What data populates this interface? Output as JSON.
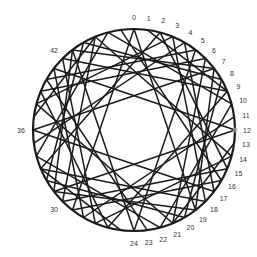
{
  "diagram": {
    "type": "circular-chord-diagram",
    "node_count": 48,
    "center": [
      134,
      130
    ],
    "radius": 101,
    "label_radius": 113,
    "colors": {
      "stroke": "#1a1a1a",
      "label": "#333333",
      "background": "#ffffff"
    },
    "labels": [
      {
        "node": 0,
        "text": "0"
      },
      {
        "node": 1,
        "text": "1"
      },
      {
        "node": 2,
        "text": "2"
      },
      {
        "node": 3,
        "text": "3"
      },
      {
        "node": 4,
        "text": "4"
      },
      {
        "node": 5,
        "text": "5"
      },
      {
        "node": 6,
        "text": "6"
      },
      {
        "node": 7,
        "text": "7"
      },
      {
        "node": 8,
        "text": "8"
      },
      {
        "node": 9,
        "text": "9"
      },
      {
        "node": 10,
        "text": "10"
      },
      {
        "node": 11,
        "text": "11"
      },
      {
        "node": 12,
        "text": "12"
      },
      {
        "node": 13,
        "text": "13"
      },
      {
        "node": 14,
        "text": "14"
      },
      {
        "node": 15,
        "text": "15"
      },
      {
        "node": 16,
        "text": "16"
      },
      {
        "node": 17,
        "text": "17"
      },
      {
        "node": 18,
        "text": "18"
      },
      {
        "node": 19,
        "text": "19"
      },
      {
        "node": 20,
        "text": "20"
      },
      {
        "node": 21,
        "text": "21"
      },
      {
        "node": 22,
        "text": "22"
      },
      {
        "node": 23,
        "text": "23"
      },
      {
        "node": 24,
        "text": "24"
      },
      {
        "node": 30,
        "text": "30"
      },
      {
        "node": 36,
        "text": "36"
      },
      {
        "node": 42,
        "text": "42"
      }
    ],
    "marker_node": 12,
    "chords": [
      [
        0,
        19
      ],
      [
        0,
        29
      ],
      [
        2,
        33
      ],
      [
        2,
        15
      ],
      [
        4,
        35
      ],
      [
        4,
        17
      ],
      [
        6,
        21
      ],
      [
        6,
        39
      ],
      [
        12,
        31
      ],
      [
        12,
        41
      ],
      [
        14,
        45
      ],
      [
        14,
        27
      ],
      [
        16,
        47
      ],
      [
        16,
        29
      ],
      [
        18,
        33
      ],
      [
        18,
        3
      ],
      [
        24,
        43
      ],
      [
        24,
        5
      ],
      [
        26,
        9
      ],
      [
        26,
        39
      ],
      [
        28,
        11
      ],
      [
        28,
        41
      ],
      [
        30,
        45
      ],
      [
        30,
        15
      ],
      [
        36,
        7
      ],
      [
        36,
        17
      ],
      [
        38,
        21
      ],
      [
        38,
        3
      ],
      [
        40,
        23
      ],
      [
        40,
        5
      ],
      [
        42,
        9
      ],
      [
        42,
        27
      ],
      [
        1,
        9
      ],
      [
        13,
        21
      ],
      [
        25,
        33
      ],
      [
        37,
        45
      ],
      [
        7,
        43
      ],
      [
        19,
        7
      ],
      [
        31,
        19
      ],
      [
        43,
        31
      ],
      [
        8,
        44
      ],
      [
        20,
        8
      ],
      [
        32,
        20
      ],
      [
        44,
        32
      ],
      [
        10,
        46
      ],
      [
        22,
        10
      ],
      [
        34,
        22
      ],
      [
        46,
        34
      ]
    ]
  }
}
